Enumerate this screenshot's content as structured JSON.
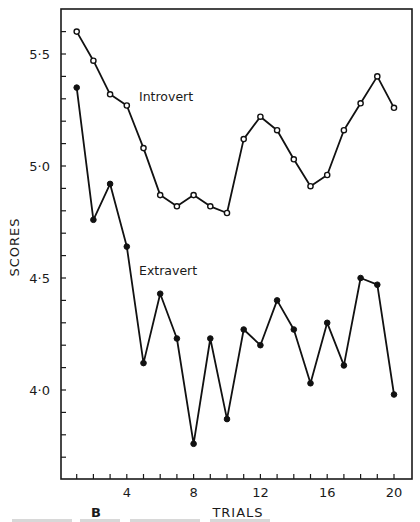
{
  "figure": {
    "panel_label": "B",
    "series_labels": {
      "introvert": "Introvert",
      "extravert": "Extravert"
    }
  },
  "chart_data": {
    "type": "line",
    "title": "",
    "xlabel": "TRIALS",
    "ylabel": "SCORES",
    "panel": "B",
    "x": [
      1,
      2,
      3,
      4,
      5,
      6,
      7,
      8,
      9,
      10,
      11,
      12,
      13,
      14,
      15,
      16,
      17,
      18,
      19,
      20
    ],
    "xlim": [
      0,
      21
    ],
    "ylim": [
      3.61,
      5.71
    ],
    "x_ticks": [
      4,
      8,
      12,
      16,
      20
    ],
    "x_tick_labels": [
      "4",
      "8",
      "12",
      "16",
      "20"
    ],
    "x_minor_ticks_every": 1,
    "y_ticks": [
      4.0,
      4.5,
      5.0,
      5.5
    ],
    "y_tick_labels": [
      "4·0",
      "4·5",
      "5·0",
      "5·5"
    ],
    "y_minor_ticks_every": 0.1,
    "grid": false,
    "legend": "inline labels",
    "series": [
      {
        "name": "Introvert",
        "marker": "open-circle",
        "values": [
          5.6,
          5.47,
          5.32,
          5.27,
          5.08,
          4.87,
          4.82,
          4.87,
          4.82,
          4.79,
          5.12,
          5.22,
          5.16,
          5.03,
          4.91,
          4.96,
          5.16,
          5.28,
          5.4,
          5.26
        ]
      },
      {
        "name": "Extravert",
        "marker": "filled-circle",
        "values": [
          5.35,
          4.76,
          4.92,
          4.64,
          4.12,
          4.43,
          4.23,
          3.76,
          4.23,
          3.87,
          4.27,
          4.2,
          4.4,
          4.27,
          4.03,
          4.3,
          4.11,
          4.5,
          4.47,
          3.98
        ]
      }
    ]
  }
}
